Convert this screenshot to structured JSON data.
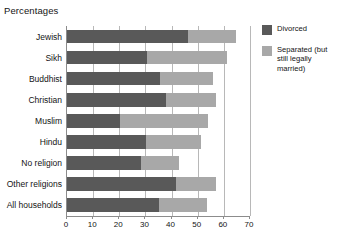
{
  "chart_data": {
    "type": "bar",
    "orientation": "horizontal",
    "stacked": true,
    "title": "Percentages",
    "xlabel": "",
    "ylabel": "",
    "xlim": [
      0,
      70
    ],
    "xticks": [
      0,
      10,
      20,
      30,
      40,
      50,
      60,
      70
    ],
    "xtick_labels": [
      "0",
      "10",
      "20",
      "30",
      "40",
      "50",
      "60",
      "70"
    ],
    "grid": true,
    "grid_axis": "x",
    "legend_position": "right",
    "categories": [
      "Jewish",
      "Sikh",
      "Buddhist",
      "Christian",
      "Muslim",
      "Hindu",
      "No religion",
      "Other religions",
      "All households"
    ],
    "series": [
      {
        "name": "Divorced",
        "color": "#595959",
        "values": [
          46.2,
          30.7,
          35.6,
          37.7,
          20.4,
          30.3,
          28.4,
          41.8,
          35.0
        ]
      },
      {
        "name": "Separated (but still legally married)",
        "color": "#a8a8a8",
        "values": [
          18.3,
          30.5,
          20.2,
          19.4,
          33.6,
          21.0,
          14.6,
          15.3,
          18.5
        ]
      }
    ],
    "totals": [
      64.5,
      61.2,
      55.8,
      57.1,
      54.0,
      51.3,
      43.0,
      57.1,
      53.5
    ]
  },
  "legend": {
    "items": [
      {
        "label": "Divorced",
        "swatch": "divorced"
      },
      {
        "label": "Separated (but still legally married)",
        "swatch": "separated"
      }
    ]
  },
  "colors": {
    "divorced": "#595959",
    "separated": "#a8a8a8",
    "grid": "#b8b8b8",
    "axis": "#8c8c8c",
    "text": "#141414",
    "background": "#ffffff"
  }
}
